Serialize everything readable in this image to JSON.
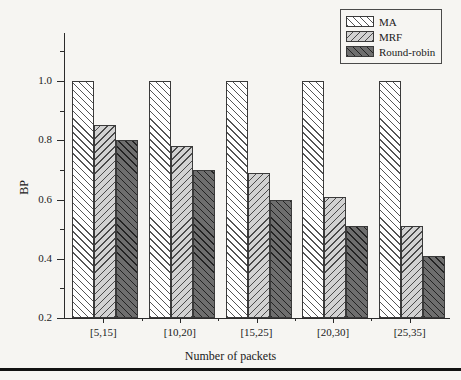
{
  "chart_data": {
    "type": "bar",
    "title": "",
    "xlabel": "Number of packets",
    "ylabel": "BP",
    "categories": [
      "[5,15]",
      "[10,20]",
      "[15,25]",
      "[20,30]",
      "[25,35]"
    ],
    "series": [
      {
        "name": "MA",
        "color": "#ffffff",
        "hatch": "/",
        "values": [
          1.0,
          1.0,
          1.0,
          1.0,
          1.0
        ]
      },
      {
        "name": "MRF",
        "color": "#d2d2d2",
        "hatch": "\\",
        "values": [
          0.85,
          0.78,
          0.69,
          0.61,
          0.51
        ]
      },
      {
        "name": "Round-robin",
        "color": "#6e6e6e",
        "hatch": "/",
        "values": [
          0.8,
          0.7,
          0.6,
          0.51,
          0.41
        ]
      }
    ],
    "ylim": [
      0.2,
      1.0
    ],
    "ytick_labels": [
      "1.0",
      "0.8",
      "0.6",
      "0.4",
      "0.2"
    ],
    "ytick_values": [
      1.0,
      0.8,
      0.6,
      0.4,
      0.2
    ],
    "yminor_values": [
      0.9,
      0.7,
      0.5,
      0.3
    ],
    "grid": false,
    "legend_position": "top-right"
  },
  "legend": {
    "items": [
      {
        "label": "MA"
      },
      {
        "label": "MRF"
      },
      {
        "label": "Round-robin"
      }
    ]
  },
  "axes": {
    "x_title": "Number of packets",
    "y_title": "BP"
  }
}
